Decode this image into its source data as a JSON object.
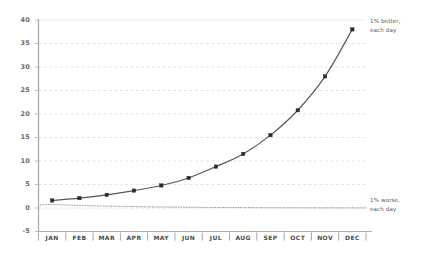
{
  "chart_data": {
    "type": "line",
    "title": "",
    "subtitle": "",
    "xlabel": "",
    "ylabel": "",
    "categories": [
      "JAN",
      "FEB",
      "MAR",
      "APR",
      "MAY",
      "JUN",
      "JUL",
      "AUG",
      "SEP",
      "OCT",
      "NOV",
      "DEC"
    ],
    "series": [
      {
        "name": "1% better, each day",
        "style": "solid-with-markers",
        "color": "#555555",
        "values": [
          1.6,
          2.1,
          2.8,
          3.7,
          4.8,
          6.4,
          8.8,
          11.5,
          15.5,
          20.8,
          28.0,
          38.0
        ]
      },
      {
        "name": "1% worse, each day",
        "style": "dotted",
        "color": "#8a8a8a",
        "values": [
          0.73,
          0.55,
          0.4,
          0.3,
          0.22,
          0.16,
          0.11,
          0.08,
          0.06,
          0.04,
          0.03,
          0.02
        ]
      }
    ],
    "ylim": [
      -5,
      40
    ],
    "yticks": [
      -5,
      0,
      5,
      10,
      15,
      20,
      25,
      30,
      35,
      40
    ],
    "ytick_labels": [
      "-5",
      "0",
      "5",
      "10",
      "15",
      "20",
      "25",
      "30",
      "35",
      "40"
    ],
    "xtick_labels": [
      "JAN",
      "FEB",
      "MAR",
      "APR",
      "MAY",
      "JUN",
      "JUL",
      "AUG",
      "SEP",
      "OCT",
      "NOV",
      "DEC"
    ],
    "grid": true,
    "grid_style": "dashed-horizontal",
    "grid_color": "#d8d8e2",
    "legend": "annotations-right",
    "annotations": [
      {
        "id": "better",
        "text": "1% better,\neach day",
        "anchor_month": "DEC",
        "anchor_value": 38.0
      },
      {
        "id": "worse",
        "text": "1% worse,\neach day",
        "anchor_month": "DEC",
        "anchor_value": 0.02
      }
    ],
    "axis_color": "#b0b0b0",
    "background": "#ffffff"
  },
  "annotations": {
    "better": "1% better,\neach day",
    "worse": "1% worse,\neach day"
  }
}
